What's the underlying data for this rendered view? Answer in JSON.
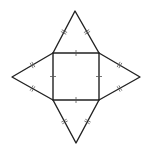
{
  "figure": {
    "stroke_color": "#222222",
    "tick_color": "#555555",
    "background": "#ffffff",
    "square": {
      "x1": 53,
      "y1": 53,
      "x2": 99,
      "y2": 100,
      "tick_count_per_side": 1
    },
    "triangles": [
      {
        "name": "top",
        "apex": [
          75,
          11
        ],
        "base": [
          [
            53,
            53
          ],
          [
            99,
            53
          ]
        ],
        "tick_count_per_leg": 2
      },
      {
        "name": "right",
        "apex": [
          140,
          77
        ],
        "base": [
          [
            99,
            53
          ],
          [
            99,
            100
          ]
        ],
        "tick_count_per_leg": 2
      },
      {
        "name": "bottom",
        "apex": [
          76,
          143
        ],
        "base": [
          [
            53,
            100
          ],
          [
            99,
            100
          ]
        ],
        "tick_count_per_leg": 2
      },
      {
        "name": "left",
        "apex": [
          12,
          77
        ],
        "base": [
          [
            53,
            53
          ],
          [
            53,
            100
          ]
        ],
        "tick_count_per_leg": 2
      }
    ]
  }
}
